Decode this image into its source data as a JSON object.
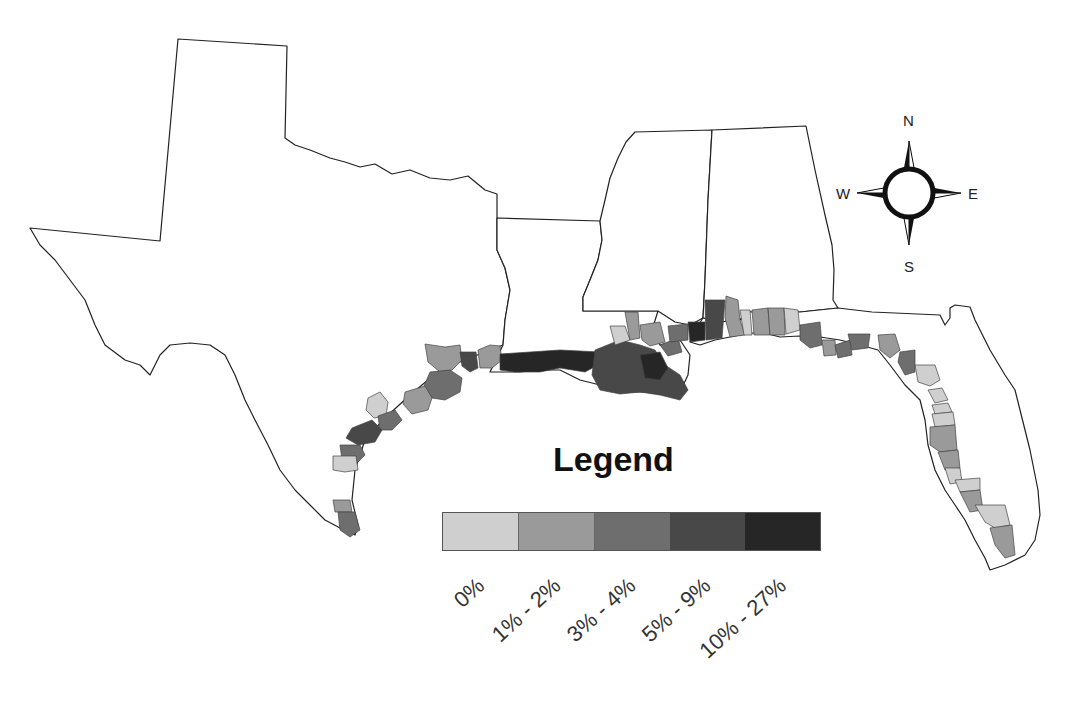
{
  "map": {
    "states": [
      "Texas",
      "Louisiana",
      "Mississippi",
      "Alabama",
      "Florida"
    ],
    "colors": {
      "c0": "#cfcfcf",
      "c1": "#9a9a9a",
      "c2": "#6e6e6e",
      "c3": "#484848",
      "c4": "#262626"
    }
  },
  "legend": {
    "title": "Legend",
    "classes": [
      {
        "label": "0%",
        "color": "#cfcfcf"
      },
      {
        "label": "1% - 2%",
        "color": "#9a9a9a"
      },
      {
        "label": "3% - 4%",
        "color": "#6e6e6e"
      },
      {
        "label": "5% - 9%",
        "color": "#484848"
      },
      {
        "label": "10% - 27%",
        "color": "#262626"
      }
    ]
  },
  "compass": {
    "n": "N",
    "s": "S",
    "e": "E",
    "w": "W"
  }
}
